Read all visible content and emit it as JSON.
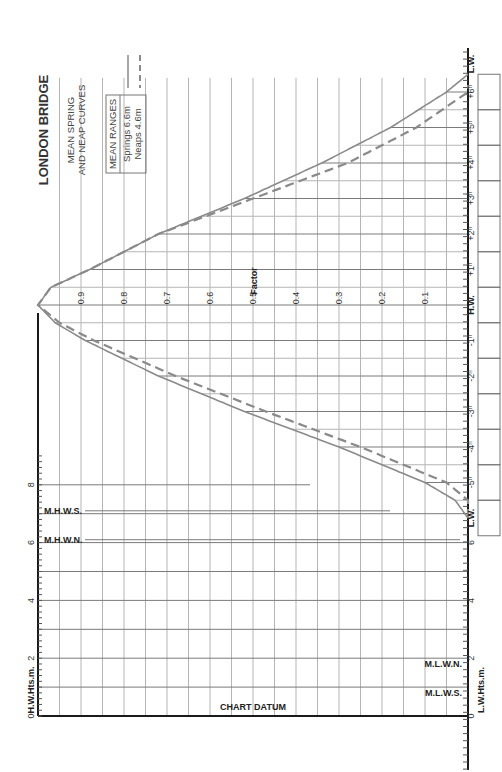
{
  "chart_data": {
    "type": "line",
    "title": "LONDON BRIDGE",
    "subtitle": [
      "MEAN SPRING",
      "AND NEAP CURVES"
    ],
    "orientation": "rotated 90 degrees counter-clockwise",
    "legend": {
      "heading": "MEAN RANGES",
      "entries": [
        {
          "name": "Springs",
          "range": "6.6m",
          "style": "solid"
        },
        {
          "name": "Neaps",
          "range": "4.6m",
          "style": "dashed"
        }
      ]
    },
    "factor_axis": {
      "label": "Factor",
      "ticks": [
        "0.9",
        "0.8",
        "0.7",
        "0.6",
        "0.5",
        "0.4",
        "0.3",
        "0.2",
        "0.1"
      ]
    },
    "time_axis": {
      "ticks": [
        "L.W.",
        "+6h",
        "+5h",
        "+4h",
        "+3h",
        "+2h",
        "+1h",
        "H.W.",
        "-1h",
        "-2h",
        "-3h",
        "-4h",
        "-5h",
        "L.W."
      ]
    },
    "hw_heights_axis": {
      "label": "H.W.Hts.m.",
      "ticks": [
        "0",
        "2",
        "4",
        "6",
        "8"
      ],
      "markers": [
        "M.H.W.S.",
        "M.H.W.N."
      ]
    },
    "lw_heights_axis": {
      "label": "L.W.Hts.m.",
      "ticks": [
        "0",
        "2",
        "4",
        "6"
      ],
      "markers": [
        "M.L.W.N.",
        "M.L.W.S."
      ]
    },
    "datum_label": "CHART DATUM",
    "x": [
      -6,
      -5.5,
      -5,
      -4,
      -3,
      -2,
      -1,
      -0.5,
      0,
      0.5,
      1,
      2,
      3,
      4,
      5,
      6,
      6.5
    ],
    "series": [
      {
        "name": "Springs (6.6m)",
        "values": [
          0.0,
          0.03,
          0.1,
          0.3,
          0.52,
          0.72,
          0.89,
          0.96,
          1.0,
          0.97,
          0.88,
          0.72,
          0.52,
          0.34,
          0.18,
          0.05,
          0.0
        ]
      },
      {
        "name": "Neaps (4.6m)",
        "values": [
          0.0,
          0.0,
          0.05,
          0.25,
          0.47,
          0.68,
          0.87,
          0.95,
          1.0,
          0.97,
          0.88,
          0.72,
          0.5,
          0.28,
          0.12,
          0.0,
          0.0
        ]
      }
    ],
    "ylim": [
      0,
      1
    ],
    "grid": true
  }
}
